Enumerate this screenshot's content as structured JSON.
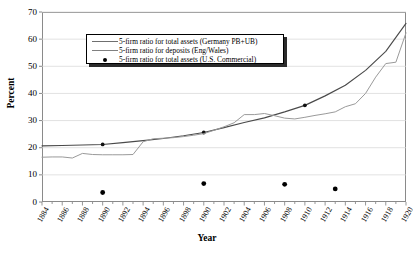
{
  "chart_data": {
    "type": "line",
    "title": "",
    "xlabel": "Year",
    "ylabel": "Percent",
    "xlim": [
      1884,
      1920
    ],
    "ylim": [
      0,
      70
    ],
    "ytick_step": 10,
    "xtick_step": 2,
    "grid": true,
    "legend_position": "upper-left-inside",
    "yticks": [
      "0",
      "10",
      "20",
      "30",
      "40",
      "50",
      "60",
      "70"
    ],
    "xticks": [
      "1884",
      "1886",
      "1888",
      "1890",
      "1892",
      "1894",
      "1896",
      "1898",
      "1900",
      "1902",
      "1904",
      "1906",
      "1908",
      "1910",
      "1912",
      "1914",
      "1916",
      "1918",
      "1920"
    ],
    "series": [
      {
        "name": "5-firm ratio for total assets (Germany PB+UB)",
        "type": "line-with-markers",
        "color": "#4a4a4a",
        "marker_years": [
          1890,
          1900,
          1910
        ],
        "x": [
          1884,
          1886,
          1888,
          1890,
          1892,
          1894,
          1896,
          1898,
          1900,
          1902,
          1904,
          1906,
          1908,
          1910,
          1912,
          1914,
          1916,
          1918,
          1920
        ],
        "y": [
          20.7,
          20.8,
          21.0,
          21.2,
          21.9,
          22.6,
          23.4,
          24.4,
          25.6,
          27.4,
          29.3,
          31.0,
          33.2,
          35.6,
          39.1,
          43.0,
          48.5,
          55.5,
          65.8
        ]
      },
      {
        "name": "5-firm ratio for deposits (Eng/Wales)",
        "type": "line",
        "color": "#9a9a9a",
        "x": [
          1884,
          1885,
          1886,
          1887,
          1888,
          1889,
          1890,
          1891,
          1892,
          1893,
          1894,
          1895,
          1896,
          1897,
          1898,
          1899,
          1900,
          1901,
          1902,
          1903,
          1904,
          1905,
          1906,
          1907,
          1908,
          1909,
          1910,
          1911,
          1912,
          1913,
          1914,
          1915,
          1916,
          1917,
          1918,
          1919,
          1920
        ],
        "y": [
          16.5,
          16.6,
          16.6,
          16.2,
          17.9,
          17.5,
          17.4,
          17.4,
          17.4,
          17.5,
          22.2,
          23.3,
          23.5,
          23.7,
          24.1,
          24.6,
          25.2,
          26.4,
          27.7,
          29.2,
          32.2,
          32.2,
          32.6,
          31.8,
          30.9,
          30.6,
          31.2,
          31.9,
          32.5,
          33.2,
          35.1,
          36.2,
          40.0,
          46.0,
          51.0,
          51.5,
          62.3
        ]
      },
      {
        "name": "5-firm ratio for total assets (U.S. Commercial)",
        "type": "scatter",
        "color": "#000000",
        "x": [
          1890,
          1900,
          1908,
          1913
        ],
        "y": [
          3.5,
          6.8,
          6.5,
          4.8
        ]
      }
    ]
  },
  "legend": {
    "items": [
      {
        "label": "5-firm ratio for total assets (Germany PB+UB)",
        "key": "line"
      },
      {
        "label": "5-firm ratio for deposits (Eng/Wales)",
        "key": "line"
      },
      {
        "label": "5-firm ratio for total assets (U.S. Commercial)",
        "key": "dot"
      }
    ]
  },
  "axes": {
    "y_title": "Percent",
    "x_title": "Year"
  }
}
